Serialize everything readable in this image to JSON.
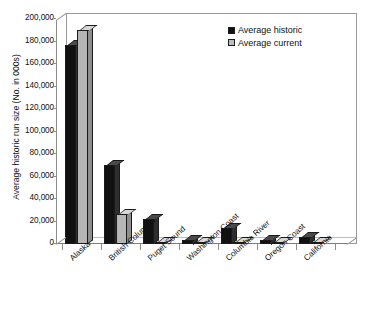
{
  "chart_data": {
    "type": "bar",
    "title": "",
    "xlabel": "",
    "ylabel": "Average historic run size (No. in 000s)",
    "ylim": [
      0,
      200000
    ],
    "ytick_values": [
      0,
      20000,
      40000,
      60000,
      80000,
      100000,
      120000,
      140000,
      160000,
      180000,
      200000
    ],
    "ytick_labels": [
      "0",
      "20,000",
      "40,000",
      "60,000",
      "80,000",
      "100,000",
      "120,000",
      "140,000",
      "160,000",
      "180,000",
      "200,000"
    ],
    "grid": false,
    "legend_position": "top-right",
    "style": "3d-clustered-column",
    "categories": [
      "Alaska",
      "British Columbia",
      "Puget Sound",
      "Washington Coast",
      "Columbia River",
      "Oregon Coast",
      "California"
    ],
    "series": [
      {
        "name": "Average historic",
        "color": "#111111",
        "values": [
          177000,
          70000,
          22000,
          4000,
          14000,
          4000,
          6000
        ]
      },
      {
        "name": "Average current",
        "color": "#b6b6b6",
        "values": [
          190000,
          27000,
          1500,
          1000,
          1000,
          800,
          800
        ]
      }
    ]
  },
  "legend": {
    "items": [
      {
        "label": "Average historic",
        "swatch": "historic"
      },
      {
        "label": "Average current",
        "swatch": "current"
      }
    ]
  }
}
